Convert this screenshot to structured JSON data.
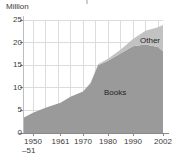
{
  "chart_data": {
    "type": "area",
    "stacked": true,
    "title": "",
    "xlabel": "",
    "ylabel": "Million",
    "unit_label": "Million",
    "ylim": [
      0,
      25
    ],
    "yticks": [
      0,
      5,
      10,
      15,
      20,
      25
    ],
    "ytick_labels": [
      "0",
      "5",
      "10",
      "15",
      "20",
      "25"
    ],
    "grid": true,
    "xlim": [
      1946,
      2002
    ],
    "xticks": [
      1950,
      1961,
      1970,
      1980,
      1990,
      2002
    ],
    "xtick_labels": [
      "1950",
      "1961",
      "1970",
      "1980",
      "1990",
      "2002"
    ],
    "xtick_sublabel": "–51",
    "xtick_sublabel_for": "1950",
    "legend_position": "inline-annotations",
    "series": [
      {
        "name": "Books",
        "color": "#9a9a9a",
        "x": [
          1946,
          1950,
          1955,
          1961,
          1965,
          1970,
          1973,
          1976,
          1980,
          1985,
          1990,
          1995,
          2000,
          2002
        ],
        "values": [
          3.3,
          4.5,
          5.6,
          6.7,
          8.0,
          9.2,
          11.0,
          15.0,
          16.0,
          17.6,
          19.2,
          19.6,
          19.0,
          18.1
        ]
      },
      {
        "name": "Other",
        "color": "#c2c2c2",
        "x": [
          1946,
          1950,
          1955,
          1961,
          1965,
          1970,
          1973,
          1976,
          1980,
          1985,
          1990,
          1995,
          2000,
          2002
        ],
        "values": [
          0.0,
          0.0,
          0.0,
          0.0,
          0.0,
          0.0,
          0.1,
          0.2,
          0.4,
          0.8,
          1.6,
          3.0,
          4.4,
          5.8
        ]
      }
    ],
    "annotations": [
      {
        "text": "Other",
        "x_px": 140,
        "y_px": 36
      },
      {
        "text": "Books",
        "x_px": 104,
        "y_px": 88
      }
    ],
    "totals_note": "Total reaches about 24 million in 2002"
  },
  "axes": {
    "unit": "Million"
  }
}
